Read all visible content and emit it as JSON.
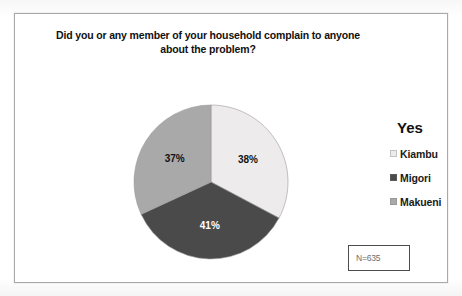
{
  "chart_data": {
    "type": "pie",
    "title": "Did you or any member of your household complain to anyone about the problem?",
    "title_lines": [
      "Did you or any member of your household complain to anyone",
      "about the problem?"
    ],
    "legend_title": "Yes",
    "legend_position": "right",
    "categories": [
      "Kiambu",
      "Migori",
      "Makueni"
    ],
    "values": [
      38,
      41,
      37
    ],
    "value_labels": [
      "38%",
      "41%",
      "37%"
    ],
    "unit": "percent",
    "start_angle_deg": 0,
    "direction": "clockwise",
    "colors": [
      "#edebeb",
      "#4a4a4a",
      "#a9a9a9"
    ],
    "label_colors": [
      "#111111",
      "#ffffff",
      "#111111"
    ],
    "slices": [
      {
        "name": "Kiambu",
        "value": 38,
        "label": "38%",
        "color": "#edebeb",
        "label_color": "#111111"
      },
      {
        "name": "Migori",
        "value": 41,
        "label": "41%",
        "color": "#4a4a4a",
        "label_color": "#ffffff"
      },
      {
        "name": "Makueni",
        "value": 37,
        "label": "37%",
        "color": "#a9a9a9",
        "label_color": "#111111"
      }
    ],
    "annotation": "N=635",
    "grid": false,
    "xlabel": "",
    "ylabel": ""
  },
  "legend": {
    "title": "Yes",
    "items": [
      {
        "label": "Kiambu",
        "color": "#edebeb"
      },
      {
        "label": "Migori",
        "color": "#4a4a4a"
      },
      {
        "label": "Makueni",
        "color": "#a9a9a9"
      }
    ]
  },
  "annotation_box": {
    "text": "N=635"
  }
}
